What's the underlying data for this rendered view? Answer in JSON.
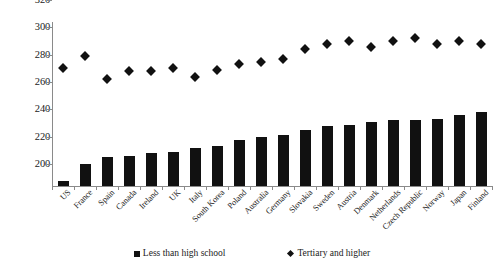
{
  "chart_data": {
    "type": "bar",
    "title": "",
    "subtitle": "",
    "xlabel": "",
    "ylabel": "",
    "ylim": [
      200,
      320
    ],
    "ytick_step": 20,
    "yticks": [
      200,
      220,
      240,
      260,
      280,
      300,
      320
    ],
    "grid": false,
    "legend_position": "bottom",
    "categories": [
      "US",
      "France",
      "Spain",
      "Canada",
      "Ireland",
      "UK",
      "Italy",
      "South Korea",
      "Poland",
      "Australia",
      "Germany",
      "Slovakia",
      "Sweden",
      "Austria",
      "Denmark",
      "Netherlands",
      "Czech Republic",
      "Norway",
      "Japan",
      "Finland"
    ],
    "series": [
      {
        "name": "Less than high school",
        "marker": "square",
        "color": "#111111",
        "render": "bar",
        "values": [
          204,
          216,
          221,
          222,
          224,
          225,
          228,
          229,
          234,
          236,
          237,
          241,
          244,
          245,
          247,
          248,
          248,
          249,
          252,
          254
        ]
      },
      {
        "name": "Tertiary and higher",
        "marker": "diamond",
        "color": "#111111",
        "render": "scatter",
        "values": [
          286,
          295,
          278,
          284,
          284,
          286,
          280,
          285,
          289,
          291,
          293,
          300,
          304,
          306,
          302,
          306,
          308,
          304,
          306,
          304
        ]
      }
    ]
  },
  "legend": {
    "items": [
      {
        "label": "Less than high school",
        "marker": "square-marker-icon"
      },
      {
        "label": "Tertiary and higher",
        "marker": "diamond-marker-icon"
      }
    ]
  }
}
